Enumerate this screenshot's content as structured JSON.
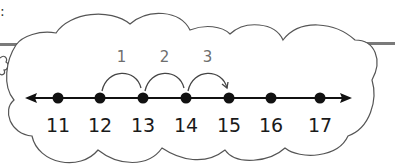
{
  "diagram": {
    "type": "number-line-with-hops",
    "corner_mark": ":",
    "number_line": {
      "ticks": [
        {
          "value": "11",
          "x": 58
        },
        {
          "value": "12",
          "x": 100
        },
        {
          "value": "13",
          "x": 143
        },
        {
          "value": "14",
          "x": 186
        },
        {
          "value": "15",
          "x": 229
        },
        {
          "value": "16",
          "x": 271
        },
        {
          "value": "17",
          "x": 320
        }
      ],
      "y": 98,
      "start_x": 25,
      "end_x": 352,
      "arrows": "both"
    },
    "hops": [
      {
        "label": "1",
        "from": "12",
        "to": "13"
      },
      {
        "label": "2",
        "from": "13",
        "to": "14"
      },
      {
        "label": "3",
        "from": "14",
        "to": "15"
      }
    ],
    "colors": {
      "line": "#111111",
      "dots": "#111111",
      "cloud_stroke": "#555555",
      "hop_stroke": "#444444",
      "hop_label": "#6e6e6e",
      "bar": "#7a7a7a"
    }
  }
}
